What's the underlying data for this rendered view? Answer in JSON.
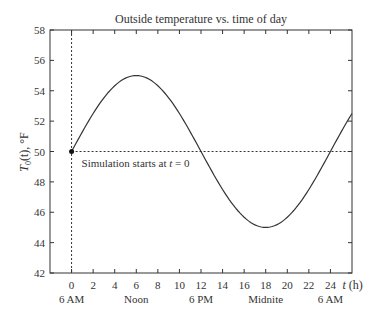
{
  "chart_data": {
    "type": "line",
    "title": "Outside temperature vs. time of day",
    "xlabel": "t (h)",
    "ylabel": "T0(t), °F",
    "xlim": [
      -2,
      26
    ],
    "ylim": [
      42,
      58
    ],
    "xticks": [
      0,
      2,
      4,
      6,
      8,
      10,
      12,
      14,
      16,
      18,
      20,
      22,
      24
    ],
    "yticks": [
      42,
      44,
      46,
      48,
      50,
      52,
      54,
      56,
      58
    ],
    "time_labels": [
      {
        "t": 0,
        "label": "6 AM"
      },
      {
        "t": 6,
        "label": "Noon"
      },
      {
        "t": 12,
        "label": "6 PM"
      },
      {
        "t": 18,
        "label": "Midnite"
      },
      {
        "t": 24,
        "label": "6 AM"
      }
    ],
    "grid": false,
    "series": [
      {
        "name": "Outside temperature",
        "formula": "T0(t) = 50 + 5 sin(pi t / 12)",
        "x": [
          0,
          2,
          4,
          6,
          8,
          10,
          12,
          14,
          16,
          18,
          20,
          22,
          24,
          26
        ],
        "values": [
          50,
          52.5,
          54.33,
          55,
          54.33,
          52.5,
          50,
          47.5,
          45.67,
          45,
          45.67,
          47.5,
          50,
          52.5
        ]
      }
    ],
    "reference_lines": [
      {
        "type": "horizontal",
        "y": 50,
        "style": "dotted"
      },
      {
        "type": "vertical",
        "x": 0,
        "style": "dotted"
      }
    ],
    "annotations": [
      {
        "text": "Simulation starts at t = 0",
        "x": 0,
        "y": 50,
        "marker": "dot"
      }
    ]
  },
  "labels": {
    "title": "Outside temperature vs. time of day",
    "ylabel_main": "T",
    "ylabel_sub": "0",
    "ylabel_rest": "(t), °F",
    "xlabel_var": "t",
    "xlabel_unit": " (h)",
    "annotation_prefix": "Simulation starts at ",
    "annotation_var": "t",
    "annotation_suffix": " = 0"
  }
}
